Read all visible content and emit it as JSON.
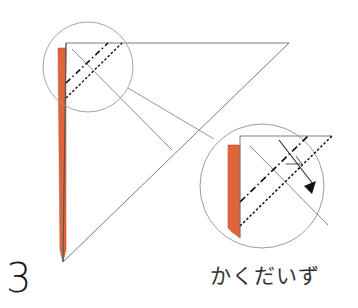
{
  "step": {
    "number": "3"
  },
  "caption": {
    "text": "かくだいず",
    "meaning": "enlarged view"
  },
  "colors": {
    "outline": "#7a7a7a",
    "paper_back": "#e0643a",
    "fold_line": "#111111",
    "circle": "#9a9a9a",
    "background": "#ffffff"
  },
  "legend": {
    "dash_dot_line": "mountain fold",
    "dotted_line": "valley fold",
    "arrow": "fold direction"
  }
}
